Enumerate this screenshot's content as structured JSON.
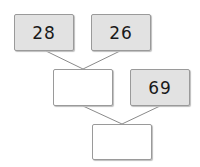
{
  "diagram": {
    "type": "number-tree",
    "boxes": [
      {
        "id": "top-left",
        "value": "28",
        "filled": true
      },
      {
        "id": "top-right",
        "value": "26",
        "filled": true
      },
      {
        "id": "middle-left",
        "value": "",
        "filled": false
      },
      {
        "id": "middle-right",
        "value": "69",
        "filled": true
      },
      {
        "id": "bottom",
        "value": "",
        "filled": false
      }
    ],
    "colors": {
      "filled": "#e2e2e2",
      "border": "#9a9a9a",
      "line": "#8a8a8a"
    }
  }
}
